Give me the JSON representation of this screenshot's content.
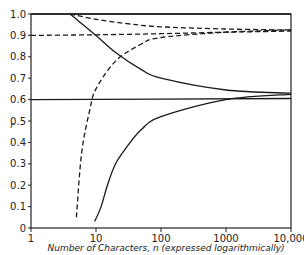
{
  "chart_data": {
    "type": "line",
    "title": "",
    "xlabel": "Number of Characters, n (expressed logarithmically)",
    "ylabel": "r",
    "xscale": "log",
    "xlim": [
      1,
      10000
    ],
    "ylim": [
      0,
      1.0
    ],
    "x_ticks": [
      "1",
      "10",
      "100",
      "1000",
      "10,000"
    ],
    "y_ticks": [
      "0",
      "0.1",
      "0.2",
      "0.3",
      "0.4",
      "0.5",
      "0.6",
      "0.7",
      "0.8",
      "0.9",
      "1.0"
    ],
    "grid": false,
    "legend": null,
    "series": [
      {
        "name": "solid-horizontal-upper",
        "style": "solid",
        "x": [
          1,
          10000
        ],
        "y": [
          1.0,
          1.0
        ]
      },
      {
        "name": "solid-horizontal-lower",
        "style": "solid",
        "x": [
          1,
          10000
        ],
        "y": [
          0.6,
          0.605
        ]
      },
      {
        "name": "dashed-horizontal",
        "style": "dashed",
        "x": [
          1,
          10,
          100,
          1000,
          10000
        ],
        "y": [
          0.9,
          0.903,
          0.908,
          0.915,
          0.92
        ]
      },
      {
        "name": "dashed-decreasing",
        "style": "dashed",
        "x": [
          4,
          10,
          30,
          100,
          1000,
          10000
        ],
        "y": [
          1.0,
          0.975,
          0.955,
          0.94,
          0.93,
          0.925
        ]
      },
      {
        "name": "solid-decreasing",
        "style": "solid",
        "x": [
          4,
          10,
          20,
          50,
          100,
          1000,
          10000
        ],
        "y": [
          1.0,
          0.9,
          0.82,
          0.74,
          0.7,
          0.645,
          0.63
        ]
      },
      {
        "name": "dashed-increasing",
        "style": "dashed",
        "x": [
          5,
          6,
          8,
          10,
          20,
          50,
          100,
          1000,
          10000
        ],
        "y": [
          0.05,
          0.35,
          0.55,
          0.65,
          0.78,
          0.86,
          0.89,
          0.915,
          0.925
        ]
      },
      {
        "name": "solid-increasing",
        "style": "solid",
        "x": [
          9.5,
          12,
          15,
          20,
          30,
          50,
          100,
          1000,
          10000
        ],
        "y": [
          0.03,
          0.1,
          0.2,
          0.3,
          0.38,
          0.46,
          0.52,
          0.6,
          0.625
        ]
      }
    ]
  }
}
